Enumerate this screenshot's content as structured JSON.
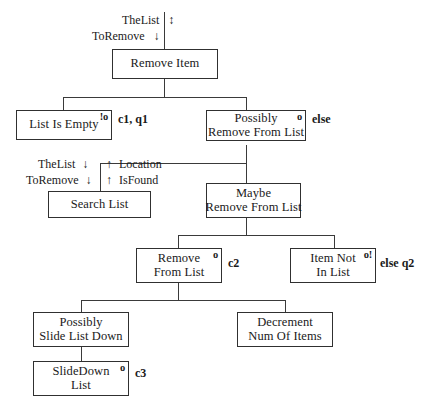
{
  "diagram": {
    "nodes": [
      {
        "id": "remove_item",
        "lines": [
          "Remove Item"
        ],
        "mark": "",
        "cond": ""
      },
      {
        "id": "list_is_empty",
        "lines": [
          "List Is Empty"
        ],
        "mark": "!o",
        "cond": "c1, q1"
      },
      {
        "id": "possibly_remove",
        "lines": [
          "Possibly",
          "Remove From List"
        ],
        "mark": "o",
        "cond": "else"
      },
      {
        "id": "search_list",
        "lines": [
          "Search List"
        ],
        "mark": "",
        "cond": ""
      },
      {
        "id": "maybe_remove",
        "lines": [
          "Maybe",
          "Remove From List"
        ],
        "mark": "",
        "cond": ""
      },
      {
        "id": "remove_from_list",
        "lines": [
          "Remove",
          "From List"
        ],
        "mark": "o",
        "cond": "c2"
      },
      {
        "id": "item_not_in_list",
        "lines": [
          "Item Not",
          "In List"
        ],
        "mark": "o!",
        "cond": "else q2"
      },
      {
        "id": "possibly_slide",
        "lines": [
          "Possibly",
          "Slide List Down"
        ],
        "mark": "",
        "cond": ""
      },
      {
        "id": "decrement_num",
        "lines": [
          "Decrement",
          "Num Of Items"
        ],
        "mark": "",
        "cond": ""
      },
      {
        "id": "slide_down_list",
        "lines": [
          "SlideDown",
          "List"
        ],
        "mark": "o",
        "cond": "c3"
      }
    ],
    "flow_annotations": {
      "top_in_1": "TheList",
      "top_in_1_arrow": "↕",
      "top_in_2": "ToRemove",
      "top_in_2_arrow": "↓",
      "search_in_1": "TheList",
      "search_in_1_arrow": "↓",
      "search_in_2": "ToRemove",
      "search_in_2_arrow": "↓",
      "search_out_1_arrow": "↑",
      "search_out_1": "Location",
      "search_out_2_arrow": "↑",
      "search_out_2": "IsFound"
    },
    "colors": {
      "box_border": "#303030",
      "connector": "#3a3a3a",
      "background": "#ffffff",
      "text": "#1a1a1a"
    }
  }
}
